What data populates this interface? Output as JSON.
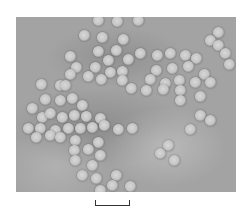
{
  "image": {
    "description": "Electron micrograph of clustered spherical virus particles",
    "particle_color": "#c8c8c8",
    "background_color": "#a3a3a3"
  },
  "scale_bar": {
    "label": ""
  },
  "particles": [
    [
      98,
      20
    ],
    [
      117,
      21
    ],
    [
      138,
      20
    ],
    [
      84,
      35
    ],
    [
      102,
      37
    ],
    [
      123,
      39
    ],
    [
      70,
      56
    ],
    [
      98,
      51
    ],
    [
      116,
      50
    ],
    [
      108,
      60
    ],
    [
      128,
      59
    ],
    [
      122,
      71
    ],
    [
      95,
      67
    ],
    [
      110,
      72
    ],
    [
      76,
      67
    ],
    [
      88,
      76
    ],
    [
      101,
      79
    ],
    [
      122,
      80
    ],
    [
      131,
      88
    ],
    [
      70,
      74
    ],
    [
      60,
      85
    ],
    [
      140,
      53
    ],
    [
      157,
      55
    ],
    [
      170,
      53
    ],
    [
      185,
      55
    ],
    [
      196,
      58
    ],
    [
      156,
      70
    ],
    [
      172,
      68
    ],
    [
      188,
      66
    ],
    [
      204,
      74
    ],
    [
      150,
      79
    ],
    [
      165,
      83
    ],
    [
      179,
      80
    ],
    [
      195,
      82
    ],
    [
      146,
      90
    ],
    [
      163,
      89
    ],
    [
      180,
      90
    ],
    [
      210,
      82
    ],
    [
      218,
      32
    ],
    [
      210,
      40
    ],
    [
      218,
      45
    ],
    [
      225,
      53
    ],
    [
      229,
      64
    ],
    [
      200,
      96
    ],
    [
      180,
      100
    ],
    [
      41,
      84
    ],
    [
      65,
      85
    ],
    [
      45,
      99
    ],
    [
      60,
      100
    ],
    [
      72,
      98
    ],
    [
      82,
      105
    ],
    [
      32,
      108
    ],
    [
      42,
      117
    ],
    [
      50,
      113
    ],
    [
      62,
      117
    ],
    [
      74,
      115
    ],
    [
      86,
      116
    ],
    [
      100,
      118
    ],
    [
      28,
      128
    ],
    [
      40,
      128
    ],
    [
      55,
      130
    ],
    [
      68,
      128
    ],
    [
      80,
      128
    ],
    [
      92,
      127
    ],
    [
      104,
      125
    ],
    [
      118,
      129
    ],
    [
      132,
      128
    ],
    [
      36,
      137
    ],
    [
      50,
      135
    ],
    [
      60,
      137
    ],
    [
      75,
      140
    ],
    [
      98,
      142
    ],
    [
      74,
      150
    ],
    [
      88,
      149
    ],
    [
      100,
      155
    ],
    [
      75,
      160
    ],
    [
      92,
      165
    ],
    [
      82,
      175
    ],
    [
      96,
      178
    ],
    [
      116,
      175
    ],
    [
      112,
      185
    ],
    [
      160,
      153
    ],
    [
      168,
      145
    ],
    [
      174,
      160
    ],
    [
      190,
      129
    ],
    [
      100,
      190
    ],
    [
      130,
      186
    ],
    [
      200,
      115
    ],
    [
      210,
      120
    ]
  ]
}
